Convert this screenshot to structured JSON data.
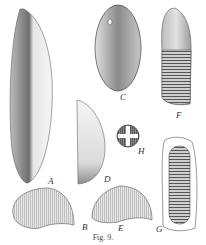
{
  "figure": {
    "caption": "Fig. 9.",
    "panels": [
      {
        "id": "A",
        "label": "A",
        "description": "elongated grain, side view, half shaded"
      },
      {
        "id": "B",
        "label": "B",
        "description": "cross-section, kidney/crescent shaped"
      },
      {
        "id": "C",
        "label": "C",
        "description": "oval grain, front view with apical pore"
      },
      {
        "id": "D",
        "label": "D",
        "description": "half-oval grain, side profile"
      },
      {
        "id": "E",
        "label": "E",
        "description": "smaller crescent cross-section"
      },
      {
        "id": "F",
        "label": "F",
        "description": "acorn-like grain with striated lower half"
      },
      {
        "id": "G",
        "label": "G",
        "description": "elongated grain with transverse striations in outline"
      },
      {
        "id": "H",
        "label": "H",
        "description": "small round grain with cross mark"
      }
    ]
  }
}
